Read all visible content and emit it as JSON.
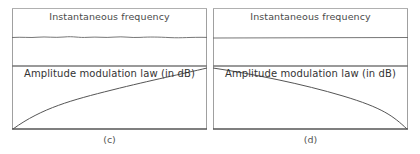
{
  "figure": {
    "panels": [
      {
        "id": "c",
        "caption": "(c)",
        "top_label": "Instantaneous frequency",
        "bottom_label": "Amplitude modulation law (in dB)",
        "frequency_trace": "constant (slight ripple)",
        "amplitude_trace": "concave increasing curve from bottom-left to top-right"
      },
      {
        "id": "d",
        "caption": "(d)",
        "top_label": "Instantaneous frequency",
        "bottom_label": "Amplitude modulation law (in dB)",
        "frequency_trace": "constant",
        "amplitude_trace": "concave decreasing curve from top-left to bottom-right"
      }
    ],
    "colors": {
      "frame": "#9a9a9a",
      "separator": "#777777",
      "trace": "#555555",
      "axis": "#555555",
      "text": "#444444"
    }
  }
}
